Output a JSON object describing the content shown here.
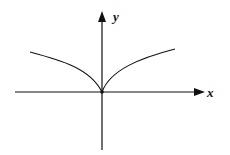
{
  "diagram": {
    "type": "function-graph",
    "axes": {
      "x_label": "x",
      "y_label": "y"
    },
    "curve": {
      "shape": "cusp at origin, increasing concave-down on both sides",
      "symmetric_about": "y-axis"
    },
    "colors": {
      "stroke": "#111111",
      "background": "#ffffff"
    }
  }
}
